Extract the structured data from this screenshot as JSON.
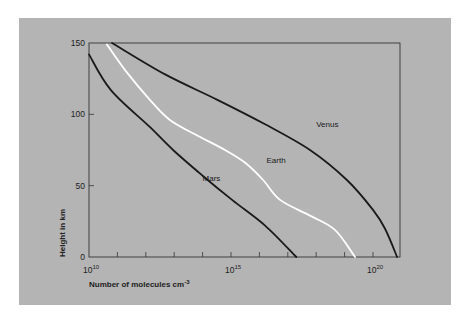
{
  "chart_data": {
    "type": "line",
    "title": "",
    "xlabel": "Number of molecules cm",
    "xlabel_exponent": "-3",
    "ylabel": "Height in km",
    "xscale": "log",
    "xlim_log10": [
      10,
      21
    ],
    "ylim": [
      0,
      150
    ],
    "grid": false,
    "legend": "inline labels on curves",
    "x_ticks": [
      {
        "log10": 10,
        "base": "10",
        "exp": "10",
        "labeled": true
      },
      {
        "log10": 11,
        "labeled": false
      },
      {
        "log10": 12,
        "labeled": false
      },
      {
        "log10": 13,
        "labeled": false
      },
      {
        "log10": 14,
        "labeled": false
      },
      {
        "log10": 15,
        "base": "10",
        "exp": "15",
        "labeled": true
      },
      {
        "log10": 16,
        "labeled": false
      },
      {
        "log10": 17,
        "labeled": false
      },
      {
        "log10": 18,
        "labeled": false
      },
      {
        "log10": 19,
        "labeled": false
      },
      {
        "log10": 20,
        "base": "10",
        "exp": "20",
        "labeled": true
      }
    ],
    "y_ticks": [
      {
        "value": 0,
        "label": "0"
      },
      {
        "value": 50,
        "label": "50"
      },
      {
        "value": 100,
        "label": "100"
      },
      {
        "value": 150,
        "label": "150"
      }
    ],
    "series": [
      {
        "name": "Mars",
        "label": "Mars",
        "color": "#1a1a1a",
        "label_at": {
          "log10": 14.0,
          "height": 53
        },
        "points": [
          {
            "log10": 10.0,
            "height": 142
          },
          {
            "log10": 10.77,
            "height": 117
          },
          {
            "log10": 12.15,
            "height": 91
          },
          {
            "log10": 12.96,
            "height": 75
          },
          {
            "log10": 14.0,
            "height": 57
          },
          {
            "log10": 15.04,
            "height": 40
          },
          {
            "log10": 16.2,
            "height": 22
          },
          {
            "log10": 17.3,
            "height": 0
          }
        ]
      },
      {
        "name": "Earth",
        "label": "Earth",
        "color": "#ffffff",
        "label_at": {
          "log10": 16.25,
          "height": 66
        },
        "points": [
          {
            "log10": 10.63,
            "height": 149
          },
          {
            "log10": 11.27,
            "height": 131
          },
          {
            "log10": 12.15,
            "height": 110
          },
          {
            "log10": 12.85,
            "height": 96
          },
          {
            "log10": 13.73,
            "height": 86
          },
          {
            "log10": 14.79,
            "height": 75
          },
          {
            "log10": 15.5,
            "height": 66
          },
          {
            "log10": 16.13,
            "height": 54
          },
          {
            "log10": 16.73,
            "height": 40
          },
          {
            "log10": 17.78,
            "height": 29
          },
          {
            "log10": 18.66,
            "height": 19
          },
          {
            "log10": 19.37,
            "height": 0
          }
        ]
      },
      {
        "name": "Venus",
        "label": "Venus",
        "color": "#1a1a1a",
        "label_at": {
          "log10": 18.0,
          "height": 91
        },
        "points": [
          {
            "log10": 10.81,
            "height": 150
          },
          {
            "log10": 12.68,
            "height": 128
          },
          {
            "log10": 14.54,
            "height": 110
          },
          {
            "log10": 16.2,
            "height": 93
          },
          {
            "log10": 17.78,
            "height": 75
          },
          {
            "log10": 19.08,
            "height": 54
          },
          {
            "log10": 20.0,
            "height": 33
          },
          {
            "log10": 20.42,
            "height": 20
          },
          {
            "log10": 20.85,
            "height": 0
          }
        ]
      }
    ]
  }
}
